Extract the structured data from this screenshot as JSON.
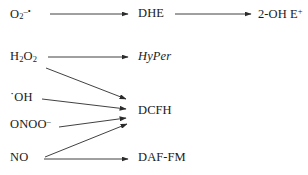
{
  "figure": {
    "background_color": "#ffffff",
    "line_color": "#2b2b2b",
    "text_color": "#1a1a1a",
    "width": 308,
    "height": 175
  },
  "species": [
    {
      "id": "superoxide",
      "base": "O",
      "subscript": "2",
      "superscript": "–•",
      "plain": "O2–•",
      "x": 10,
      "y": 14
    },
    {
      "id": "hydrogen-peroxide",
      "base": "H",
      "subscript": "2",
      "base2": "O",
      "subscript2": "2",
      "plain": "H2O2",
      "x": 10,
      "y": 57
    },
    {
      "id": "hydroxyl-radical",
      "base": "˙OH",
      "plain": "˙OH",
      "x": 10,
      "y": 98
    },
    {
      "id": "peroxynitrite",
      "base": "ONOO",
      "superscript": "–",
      "plain": "ONOO–",
      "x": 10,
      "y": 124
    },
    {
      "id": "nitric-oxide",
      "base": "NO",
      "plain": "NO",
      "x": 10,
      "y": 158
    }
  ],
  "probes": [
    {
      "id": "dhe",
      "label": "DHE",
      "italic": false,
      "x": 138,
      "y": 14
    },
    {
      "id": "hyper",
      "label": "HyPer",
      "italic": true,
      "x": 138,
      "y": 57
    },
    {
      "id": "dcfh",
      "label": "DCFH",
      "italic": false,
      "x": 138,
      "y": 111
    },
    {
      "id": "daf-fm",
      "label": "DAF-FM",
      "italic": false,
      "x": 138,
      "y": 158
    }
  ],
  "products": [
    {
      "id": "2-oh-ethidium",
      "base": "2-OH E",
      "superscript": "+",
      "plain": "2-OH E+",
      "x": 258,
      "y": 14
    }
  ],
  "arrows": [
    {
      "id": "superoxide-to-dhe",
      "from": "superoxide",
      "to": "dhe",
      "x1": 50,
      "y1": 14,
      "x2": 128,
      "y2": 14
    },
    {
      "id": "dhe-to-2-oh-ethidium",
      "from": "dhe",
      "to": "2-oh-ethidium",
      "x1": 175,
      "y1": 14,
      "x2": 251,
      "y2": 14
    },
    {
      "id": "hydrogen-peroxide-to-hyper",
      "from": "hydrogen-peroxide",
      "to": "hyper",
      "x1": 48,
      "y1": 57,
      "x2": 128,
      "y2": 57
    },
    {
      "id": "hydrogen-peroxide-to-dcfh",
      "from": "hydrogen-peroxide",
      "to": "dcfh",
      "x1": 46,
      "y1": 68,
      "x2": 126,
      "y2": 99
    },
    {
      "id": "hydroxyl-radical-to-dcfh",
      "from": "hydroxyl-radical",
      "to": "dcfh",
      "x1": 42,
      "y1": 99,
      "x2": 126,
      "y2": 109
    },
    {
      "id": "peroxynitrite-to-dcfh",
      "from": "peroxynitrite",
      "to": "dcfh",
      "x1": 59,
      "y1": 127,
      "x2": 126,
      "y2": 118
    },
    {
      "id": "nitric-oxide-to-dcfh",
      "from": "nitric-oxide",
      "to": "dcfh",
      "x1": 45,
      "y1": 157,
      "x2": 127,
      "y2": 124
    },
    {
      "id": "nitric-oxide-to-daf-fm",
      "from": "nitric-oxide",
      "to": "daf-fm",
      "x1": 44,
      "y1": 159,
      "x2": 128,
      "y2": 159
    }
  ]
}
